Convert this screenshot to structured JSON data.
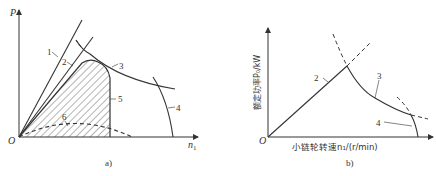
{
  "figure_a": {
    "caption": "a)",
    "y_axis_label": "P",
    "x_axis_label": "n",
    "x_axis_subscript": "1",
    "origin_label": "O",
    "curve_labels": [
      "1",
      "2",
      "3",
      "4",
      "5",
      "6"
    ]
  },
  "figure_b": {
    "caption": "b)",
    "y_axis_label": "额定功率P₀/kW",
    "x_axis_label": "小链轮转速n₁/(r/min)",
    "origin_label": "O",
    "curve_labels": [
      "2",
      "3",
      "4"
    ]
  }
}
